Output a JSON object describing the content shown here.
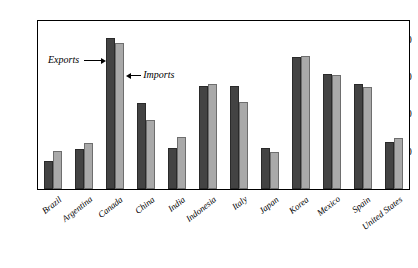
{
  "chart_data": {
    "type": "bar",
    "title": "",
    "subtitle": "",
    "xlabel": "",
    "ylabel": "",
    "ylim": [
      0,
      45
    ],
    "yticks": [
      10,
      20,
      30,
      40
    ],
    "ytick_labels": [
      "10",
      "20",
      "30",
      "40"
    ],
    "grid": false,
    "legend_position": "inline-annotation",
    "categories": [
      "Brazil",
      "Argentina",
      "Canada",
      "China",
      "India",
      "Indonesia",
      "Italy",
      "Japan",
      "Korea",
      "Mexico",
      "Spain",
      "United States"
    ],
    "series": [
      {
        "name": "Exports",
        "color": "#434343",
        "values": [
          7.5,
          10.8,
          40.5,
          23.0,
          10.9,
          27.7,
          27.5,
          11.0,
          35.3,
          30.7,
          28.2,
          12.5
        ]
      },
      {
        "name": "Imports",
        "color": "#a9a9a9",
        "values": [
          10.1,
          12.4,
          39.0,
          18.4,
          14.0,
          28.0,
          23.2,
          10.0,
          35.6,
          30.6,
          27.3,
          13.7
        ]
      }
    ],
    "annotations": [
      {
        "text": "Exports",
        "arrow": "right",
        "target": "Canada exports bar"
      },
      {
        "text": "Imports",
        "arrow": "left",
        "target": "Canada imports bar"
      }
    ]
  },
  "source_note": " "
}
